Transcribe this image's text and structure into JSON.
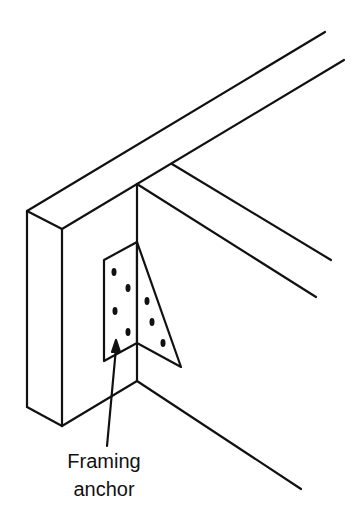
{
  "diagram": {
    "type": "isometric construction detail",
    "label": {
      "line1": "Framing",
      "line2": "anchor"
    },
    "colors": {
      "stroke": "#111111",
      "background": "#ffffff"
    }
  }
}
